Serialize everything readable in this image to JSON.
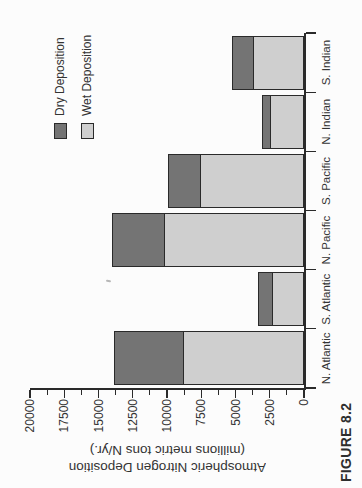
{
  "figure": {
    "caption": "FIGURE 8.2"
  },
  "chart_data": {
    "type": "bar",
    "stacked": true,
    "rotated_90_ccw": true,
    "title": "",
    "xlabel": "",
    "ylabel_lines": [
      "Atmospheric Nitrogen Deposition",
      "(millions metric tons N/yr.)"
    ],
    "categories": [
      "N. Atlantic",
      "S. Atlantic",
      "N. Pacific",
      "S. Pacific",
      "N. Indian",
      "S. Indian"
    ],
    "series": [
      {
        "name": "Dry Deposition",
        "color": "#747474",
        "values": [
          5050,
          1050,
          3850,
          2350,
          650,
          1550
        ]
      },
      {
        "name": "Wet Deposition",
        "color": "#cfcfcf",
        "values": [
          8800,
          2300,
          10200,
          7550,
          2450,
          3700
        ]
      }
    ],
    "stack_order_bottom_to_top": [
      "Wet Deposition",
      "Dry Deposition"
    ],
    "ylim": [
      0,
      20000
    ],
    "yticks": [
      0,
      2500,
      5000,
      7500,
      10000,
      12500,
      15000,
      17500,
      20000
    ],
    "minor_tick_step": 1250,
    "grid": false,
    "legend_position": "upper-right",
    "axis_color": "#2a2a2a"
  }
}
